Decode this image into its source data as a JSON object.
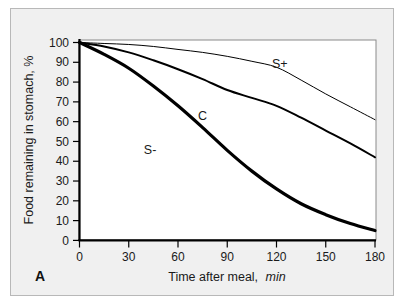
{
  "figure": {
    "panel_letter": "A",
    "background_color": "#f0f0f0",
    "plot_background_color": "#ffffff",
    "border_color": "#b8b8b8"
  },
  "chart_data": {
    "type": "line",
    "title": "",
    "subtitle": "",
    "xlabel": "Time after meal, min",
    "xlabel_main": "Time after meal,",
    "xlabel_unit": "min",
    "ylabel": "Food remaining in stomach, %",
    "xlim": [
      0,
      180
    ],
    "ylim": [
      0,
      100
    ],
    "xticks": [
      0,
      30,
      60,
      90,
      120,
      150,
      180
    ],
    "xtick_labels": [
      "0",
      "30",
      "60",
      "90",
      "120",
      "150",
      "180"
    ],
    "yticks": [
      0,
      10,
      20,
      30,
      40,
      50,
      60,
      70,
      80,
      90,
      100
    ],
    "ytick_labels": [
      "0",
      "10",
      "20",
      "30",
      "40",
      "50",
      "60",
      "70",
      "80",
      "90",
      "100"
    ],
    "grid": false,
    "legend_position": "inline-annotation",
    "x": [
      0,
      15,
      30,
      45,
      60,
      75,
      90,
      105,
      120,
      135,
      150,
      165,
      180
    ],
    "series": [
      {
        "name": "S+",
        "label": "S+",
        "label_x": 122,
        "label_y": 89,
        "color": "#000000",
        "line_width": 1,
        "values": [
          100,
          99.5,
          99,
          98,
          96.5,
          95,
          93,
          90.5,
          87.5,
          81,
          74,
          67.5,
          61
        ]
      },
      {
        "name": "C",
        "label": "C",
        "label_x": 75,
        "label_y": 63,
        "color": "#000000",
        "line_width": 2,
        "values": [
          100,
          98,
          95,
          91,
          86.5,
          81.5,
          76,
          72,
          68,
          62,
          55.5,
          49,
          42
        ]
      },
      {
        "name": "S-",
        "label": "S-",
        "label_x": 43,
        "label_y": 46,
        "color": "#000000",
        "line_width": 3.2,
        "values": [
          100,
          94,
          87,
          78,
          68,
          57,
          45.5,
          35,
          26,
          18.5,
          13,
          8.5,
          5
        ]
      }
    ]
  }
}
